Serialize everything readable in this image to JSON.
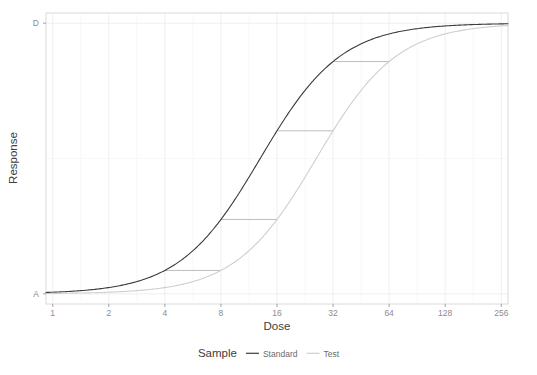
{
  "chart_data": {
    "type": "line",
    "title": "",
    "subtitle": "",
    "xlabel": "Dose",
    "ylabel": "Response",
    "xscale": "log2",
    "xlim": [
      1,
      256
    ],
    "ylim": [
      0,
      1
    ],
    "grid": true,
    "legend": {
      "position": "bottom",
      "title": "Sample",
      "entries": [
        {
          "name": "Standard",
          "color": "#3b3b3b",
          "dash": "solid"
        },
        {
          "name": "Test",
          "color": "#cfcfcf",
          "dash": "solid"
        }
      ]
    },
    "x_ticks": [
      {
        "value": 1,
        "label": "1"
      },
      {
        "value": 2,
        "label": "2"
      },
      {
        "value": 4,
        "label": "4"
      },
      {
        "value": 8,
        "label": "8"
      },
      {
        "value": 16,
        "label": "16"
      },
      {
        "value": 32,
        "label": "32"
      },
      {
        "value": 64,
        "label": "64"
      },
      {
        "value": 128,
        "label": "128"
      },
      {
        "value": 256,
        "label": "256"
      }
    ],
    "y_ticks": [
      {
        "value": 0,
        "label": "A"
      },
      {
        "value": 1,
        "label": "D"
      }
    ],
    "model": {
      "type": "4-parameter-logistic",
      "formula": "y = A + (D - A) / (1 + (x / C)^(-B))",
      "A": 0,
      "D": 1
    },
    "series": [
      {
        "name": "Standard",
        "color": "#3b3b3b",
        "width": 1.1,
        "params": {
          "A": 0,
          "D": 1,
          "B": 2.0,
          "C": 13.0
        },
        "points": [
          {
            "x": 1,
            "y": 0.0053
          },
          {
            "x": 1.41,
            "y": 0.0116
          },
          {
            "x": 2,
            "y": 0.0231
          },
          {
            "x": 2.83,
            "y": 0.0452
          },
          {
            "x": 4,
            "y": 0.0864
          },
          {
            "x": 5.66,
            "y": 0.1593
          },
          {
            "x": 8,
            "y": 0.2747
          },
          {
            "x": 11.3,
            "y": 0.4312
          },
          {
            "x": 16,
            "y": 0.6023
          },
          {
            "x": 22.6,
            "y": 0.7515
          },
          {
            "x": 32,
            "y": 0.8583
          },
          {
            "x": 45.3,
            "y": 0.9239
          },
          {
            "x": 64,
            "y": 0.9602
          },
          {
            "x": 90.5,
            "y": 0.9793
          },
          {
            "x": 128,
            "y": 0.9893
          },
          {
            "x": 181,
            "y": 0.9945
          },
          {
            "x": 256,
            "y": 0.9972
          }
        ]
      },
      {
        "name": "Test",
        "color": "#cfcfcf",
        "width": 1.1,
        "params": {
          "A": 0,
          "D": 1,
          "B": 2.0,
          "C": 26.0
        },
        "points": [
          {
            "x": 1,
            "y": 0.0015
          },
          {
            "x": 1.41,
            "y": 0.0029
          },
          {
            "x": 2,
            "y": 0.0059
          },
          {
            "x": 2.83,
            "y": 0.0117
          },
          {
            "x": 4,
            "y": 0.0231
          },
          {
            "x": 5.66,
            "y": 0.0452
          },
          {
            "x": 8,
            "y": 0.0864
          },
          {
            "x": 11.3,
            "y": 0.1593
          },
          {
            "x": 16,
            "y": 0.2747
          },
          {
            "x": 22.6,
            "y": 0.4312
          },
          {
            "x": 32,
            "y": 0.6023
          },
          {
            "x": 45.3,
            "y": 0.7515
          },
          {
            "x": 64,
            "y": 0.8583
          },
          {
            "x": 90.5,
            "y": 0.9239
          },
          {
            "x": 128,
            "y": 0.9602
          },
          {
            "x": 181,
            "y": 0.9793
          },
          {
            "x": 256,
            "y": 0.9893
          }
        ]
      }
    ],
    "connectors": [
      {
        "y": 0.0864,
        "x_standard": 4.0,
        "x_test": 8.0,
        "ratio": 2.0
      },
      {
        "y": 0.2747,
        "x_standard": 8.0,
        "x_test": 16.0,
        "ratio": 2.0
      },
      {
        "y": 0.6023,
        "x_standard": 16.0,
        "x_test": 32.0,
        "ratio": 2.0
      },
      {
        "y": 0.8583,
        "x_standard": 32.0,
        "x_test": 64.0,
        "ratio": 2.0
      }
    ],
    "annotations": []
  },
  "style": {
    "panel_background": "#ffffff",
    "panel_border": "#d9d9d9",
    "grid_major": "#ebebeb",
    "grid_minor": "#f5f5f5",
    "connector_color": "#b5b5b5",
    "axis_text": "#8c8c8c",
    "axis_title": "#3d3d3d"
  }
}
